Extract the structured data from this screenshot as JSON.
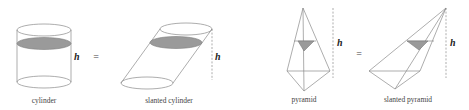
{
  "figure": {
    "shapes": [
      {
        "id": "cylinder",
        "caption": "cylinder",
        "height_label": "h"
      },
      {
        "id": "slanted-cylinder",
        "caption": "slanted cylinder",
        "height_label": "h"
      },
      {
        "id": "pyramid",
        "caption": "pyramid",
        "height_label": "h"
      },
      {
        "id": "slanted-pyramid",
        "caption": "slanted pyramid",
        "height_label": "h"
      }
    ],
    "equals": [
      "=",
      "="
    ],
    "colors": {
      "edge": "#8a8a8a",
      "cross_section_fill": "#9a9a9a",
      "background": "#ffffff"
    }
  }
}
